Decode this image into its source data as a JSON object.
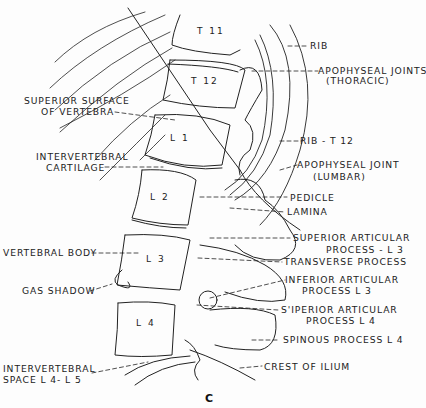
{
  "figure": {
    "panel_letter": "C",
    "vertebrae": [
      "T 11",
      "T 12",
      "L 1",
      "L 2",
      "L 3",
      "L 4"
    ],
    "labels": {
      "rib": "RIB",
      "apophyseal_thoracic_1": "APOPHYSEAL JOINTS",
      "apophyseal_thoracic_2": "(THORACIC)",
      "superior_surface_1": "SUPERIOR SURFACE",
      "superior_surface_2": "OF VERTEBRA",
      "rib_t12": "RIB - T 12",
      "intervertebral_cartilage_1": "INTERVERTEBRAL",
      "intervertebral_cartilage_2": "CARTILAGE",
      "apophyseal_lumbar_1": "APOPHYSEAL JOINT",
      "apophyseal_lumbar_2": "(LUMBAR)",
      "pedicle": "PEDICLE",
      "lamina": "LAMINA",
      "superior_articular_l3_1": "SUPERIOR ARTICULAR",
      "superior_articular_l3_2": "PROCESS - L 3",
      "vertebral_body": "VERTEBRAL BODY",
      "transverse_process": "TRANSVERSE PROCESS",
      "inferior_articular_l3_1": "INFERIOR ARTICULAR",
      "inferior_articular_l3_2": "PROCESS L 3",
      "gas_shadow": "GAS SHADOW",
      "superior_articular_l4_1": "S'IPERIOR ARTICULAR",
      "superior_articular_l4_2": "PROCESS L 4",
      "spinous_process_l4": "SPINOUS PROCESS L 4",
      "intervertebral_space_1": "INTERVERTEBRAL",
      "intervertebral_space_2": "SPACE L 4- L 5",
      "crest_of_ilium": "CREST OF ILIUM"
    }
  }
}
